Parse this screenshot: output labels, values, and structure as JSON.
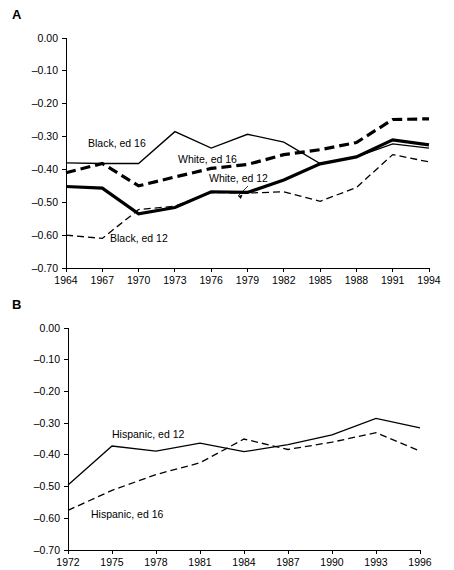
{
  "figure": {
    "panels": [
      {
        "label": "A",
        "name": "panel-a"
      },
      {
        "label": "B",
        "name": "panel-b"
      }
    ]
  },
  "chart_data": [
    {
      "panel": "A",
      "type": "line",
      "title": "",
      "subtitle": "",
      "xlabel": "",
      "ylabel": "",
      "grid": false,
      "legend_position": "inline-annotations",
      "xlim": [
        1964,
        1994
      ],
      "ylim": [
        -0.7,
        0.0
      ],
      "x": [
        1964,
        1967,
        1970,
        1973,
        1976,
        1979,
        1982,
        1985,
        1988,
        1991,
        1994
      ],
      "xticklabels": [
        "1964",
        "1967",
        "1970",
        "1973",
        "1976",
        "1979",
        "1982",
        "1985",
        "1988",
        "1991",
        "1994"
      ],
      "yticks": [
        0.0,
        -0.1,
        -0.2,
        -0.3,
        -0.4,
        -0.5,
        -0.6,
        -0.7
      ],
      "yticklabels": [
        "0.00",
        "–0.10",
        "–0.20",
        "–0.30",
        "–0.40",
        "–0.50",
        "–0.60",
        "–0.70"
      ],
      "series": [
        {
          "name": "Black, ed 16",
          "style": "thin-solid",
          "label": "Black, ed 16",
          "values": [
            -0.38,
            -0.382,
            -0.382,
            -0.285,
            -0.335,
            -0.293,
            -0.317,
            -0.382,
            -0.362,
            -0.322,
            -0.335
          ]
        },
        {
          "name": "White, ed 16",
          "style": "thick-dashed",
          "label": "White, ed 16",
          "values": [
            -0.41,
            -0.382,
            -0.45,
            -0.423,
            -0.397,
            -0.385,
            -0.355,
            -0.34,
            -0.318,
            -0.248,
            -0.246
          ]
        },
        {
          "name": "White, ed 12",
          "style": "thick-solid",
          "label": "White, ed 12",
          "values": [
            -0.452,
            -0.457,
            -0.535,
            -0.516,
            -0.468,
            -0.47,
            -0.432,
            -0.383,
            -0.362,
            -0.31,
            -0.325
          ]
        },
        {
          "name": "Black, ed 12",
          "style": "thin-dashed",
          "label": "Black, ed 12",
          "values": [
            -0.6,
            -0.61,
            -0.522,
            -0.512,
            -0.47,
            -0.472,
            -0.468,
            -0.497,
            -0.455,
            -0.355,
            -0.377
          ]
        }
      ],
      "annotations": [
        {
          "text": "Black, ed 16",
          "x": 88,
          "y": 147,
          "anchor": "start",
          "leader": null
        },
        {
          "text": "White, ed 16",
          "x": 178,
          "y": 163,
          "anchor": "start",
          "leader": null
        },
        {
          "text": "White, ed 12",
          "x": 209,
          "y": 182,
          "anchor": "start",
          "leader": {
            "x1": 248,
            "y1": 186,
            "x2": 238,
            "y2": 196
          }
        },
        {
          "text": "Black, ed 12",
          "x": 110,
          "y": 242,
          "anchor": "start",
          "leader": null
        }
      ]
    },
    {
      "panel": "B",
      "type": "line",
      "title": "",
      "subtitle": "",
      "xlabel": "",
      "ylabel": "",
      "grid": false,
      "legend_position": "inline-annotations",
      "xlim": [
        1972,
        1996
      ],
      "ylim": [
        -0.7,
        0.0
      ],
      "x": [
        1972,
        1975,
        1978,
        1981,
        1984,
        1987,
        1990,
        1993,
        1996
      ],
      "xticklabels": [
        "1972",
        "1975",
        "1978",
        "1981",
        "1984",
        "1987",
        "1990",
        "1993",
        "1996"
      ],
      "yticks": [
        0.0,
        -0.1,
        -0.2,
        -0.3,
        -0.4,
        -0.5,
        -0.6,
        -0.7
      ],
      "yticklabels": [
        "0.00",
        "–0.10",
        "–0.20",
        "–0.30",
        "–0.40",
        "–0.50",
        "–0.60",
        "–0.70"
      ],
      "series": [
        {
          "name": "Hispanic, ed 12",
          "style": "thin-solid",
          "label": "Hispanic, ed 12",
          "values": [
            -0.495,
            -0.372,
            -0.388,
            -0.363,
            -0.39,
            -0.368,
            -0.337,
            -0.285,
            -0.315
          ]
        },
        {
          "name": "Hispanic, ed 16",
          "style": "thin-dashed",
          "label": "Hispanic, ed 16",
          "values": [
            -0.575,
            -0.512,
            -0.462,
            -0.425,
            -0.35,
            -0.383,
            -0.36,
            -0.33,
            -0.388
          ]
        }
      ],
      "annotations": [
        {
          "text": "Hispanic, ed 12",
          "x": 112,
          "y": 438,
          "anchor": "start",
          "leader": null
        },
        {
          "text": "Hispanic, ed 16",
          "x": 91,
          "y": 518,
          "anchor": "start",
          "leader": null
        }
      ]
    }
  ]
}
